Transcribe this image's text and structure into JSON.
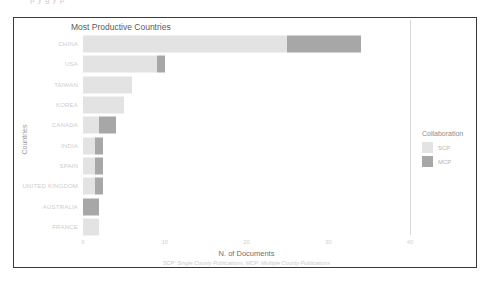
{
  "page": {
    "ghost_top_text": "p                                   y        g          y                          p"
  },
  "legend": {
    "title": "Collaboration",
    "items": [
      {
        "label": "SCP",
        "color": "#e3e3e3",
        "swatch_name": "legend-swatch-scp"
      },
      {
        "label": "MCP",
        "color": "#a7a7a7",
        "swatch_name": "legend-swatch-mcp"
      }
    ]
  },
  "chart_data": {
    "type": "bar",
    "orientation": "horizontal",
    "stacked": true,
    "title": "Most Productive Countries",
    "xlabel": "N. of Documents",
    "ylabel": "Countries",
    "caption": "SCP: Single County Publications, MCP: Multiple County Publications",
    "categories": [
      "CHINA",
      "USA",
      "TAIWAN",
      "KOREA",
      "CANADA",
      "INDIA",
      "SPAIN",
      "UNITED KINGDOM",
      "AUSTRALIA",
      "FRANCE"
    ],
    "series": [
      {
        "name": "SCP",
        "color": "#e3e3e3",
        "values": [
          25,
          9,
          6,
          5,
          2,
          1.5,
          1.5,
          1.5,
          0,
          2
        ]
      },
      {
        "name": "MCP",
        "color": "#a7a7a7",
        "values": [
          9,
          1,
          0,
          0,
          2,
          1,
          1,
          1,
          2,
          0
        ]
      }
    ],
    "totals": [
      34,
      10,
      6,
      5,
      4,
      2.5,
      2.5,
      2.5,
      2,
      2
    ],
    "xticks": [
      "0",
      "10",
      "20",
      "30",
      "40"
    ],
    "xtick_values": [
      0,
      10,
      20,
      30,
      40
    ],
    "xlim": [
      0,
      40
    ],
    "grid": false,
    "legend_position": "right"
  }
}
